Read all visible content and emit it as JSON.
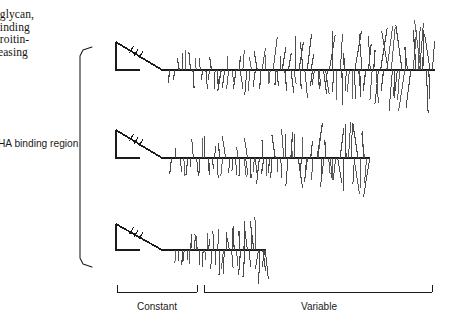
{
  "figure": {
    "type": "diagram",
    "background": "#ffffff",
    "ink": "#1a1a1a",
    "bristle_color": "#4a4a4a",
    "width": 458,
    "height": 324
  },
  "caption": {
    "lines": [
      "oglycan,",
      "binding",
      "droitin-",
      "reasing"
    ]
  },
  "left_brace": {
    "label": "HA binding region",
    "x": 80,
    "top": 47,
    "bottom": 267,
    "tip": 12
  },
  "axis_brackets": [
    {
      "name": "constant",
      "label": "Constant",
      "x1": 117,
      "x2": 197,
      "y": 292,
      "tick": 7
    },
    {
      "name": "variable",
      "label": "Variable",
      "x1": 204,
      "x2": 432,
      "y": 292,
      "tick": 7
    }
  ],
  "molecules": [
    {
      "name": "molecule-long",
      "baseline_y": 70,
      "globule": {
        "x": 116,
        "y_top": 42,
        "y_bottom": 70,
        "width": 46,
        "ticks": 3
      },
      "link_end_x": 162,
      "backbone_x1": 162,
      "backbone_x2": 435,
      "bristle_start_x": 170,
      "bristle_count": 104,
      "seed": 17,
      "up_max": 52,
      "down_max": 46,
      "density_ramp": 1.0
    },
    {
      "name": "molecule-medium",
      "baseline_y": 158,
      "globule": {
        "x": 116,
        "y_top": 130,
        "y_bottom": 158,
        "width": 46,
        "ticks": 3
      },
      "link_end_x": 162,
      "backbone_x1": 162,
      "backbone_x2": 370,
      "bristle_start_x": 172,
      "bristle_count": 74,
      "seed": 41,
      "up_max": 44,
      "down_max": 42,
      "density_ramp": 0.92
    },
    {
      "name": "molecule-short",
      "baseline_y": 250,
      "globule": {
        "x": 116,
        "y_top": 224,
        "y_bottom": 250,
        "width": 46,
        "ticks": 3
      },
      "link_end_x": 162,
      "backbone_x1": 162,
      "backbone_x2": 266,
      "bristle_start_x": 176,
      "bristle_count": 42,
      "seed": 73,
      "up_max": 38,
      "down_max": 36,
      "density_ramp": 0.85
    }
  ]
}
